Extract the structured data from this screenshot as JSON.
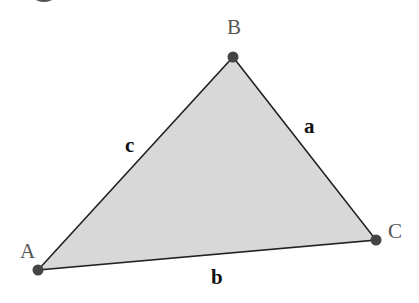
{
  "diagram": {
    "type": "triangle",
    "fill_color": "#d8d8d8",
    "edge_color": "#222222",
    "vertex_color": "#444444",
    "vertices": [
      {
        "id": "A",
        "label": "A",
        "x": 38,
        "y": 270
      },
      {
        "id": "B",
        "label": "B",
        "x": 233,
        "y": 57
      },
      {
        "id": "C",
        "label": "C",
        "x": 376,
        "y": 240
      }
    ],
    "sides": [
      {
        "id": "a",
        "label": "a",
        "from": "B",
        "to": "C"
      },
      {
        "id": "b",
        "label": "b",
        "from": "A",
        "to": "C"
      },
      {
        "id": "c",
        "label": "c",
        "from": "A",
        "to": "B"
      }
    ]
  }
}
